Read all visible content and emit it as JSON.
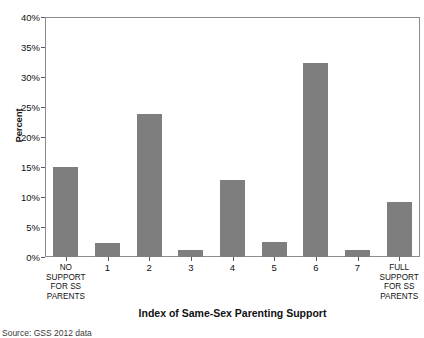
{
  "chart_data": {
    "type": "bar",
    "title": "",
    "xlabel": "Index of Same-Sex Parenting Support",
    "ylabel": "Percent",
    "categories": [
      "NO\nSUPPORT\nFOR SS\nPARENTS",
      "1",
      "2",
      "3",
      "4",
      "5",
      "6",
      "7",
      "FULL\nSUPPORT\nFOR SS\nPARENTS"
    ],
    "values": [
      15.0,
      2.3,
      23.8,
      1.1,
      12.8,
      2.5,
      32.3,
      1.2,
      9.2
    ],
    "ylim": [
      0,
      40
    ],
    "yticks": [
      0,
      5,
      10,
      15,
      20,
      25,
      30,
      35,
      40
    ],
    "ytick_labels": [
      "0%",
      "5%",
      "10%",
      "15%",
      "20%",
      "25%",
      "30%",
      "35%",
      "40%"
    ],
    "grid": false,
    "legend": null,
    "bar_color": "#7e7e7e",
    "axis_color": "#8d8d8d",
    "background_color": "#ffffff"
  },
  "footer": {
    "source": "Source: GSS 2012 data"
  }
}
